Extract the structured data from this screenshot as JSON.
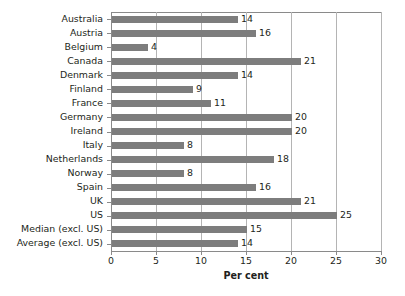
{
  "chart_data": {
    "type": "bar",
    "orientation": "horizontal",
    "title": "",
    "xlabel": "Per cent",
    "ylabel": "",
    "xlim": [
      0,
      30
    ],
    "xticks": [
      0,
      5,
      10,
      15,
      20,
      25,
      30
    ],
    "grid": "vertical",
    "legend": "none",
    "data_labels": true,
    "categories": [
      "Australia",
      "Austria",
      "Belgium",
      "Canada",
      "Denmark",
      "Finland",
      "France",
      "Germany",
      "Ireland",
      "Italy",
      "Netherlands",
      "Norway",
      "Spain",
      "UK",
      "US",
      "Median (excl. US)",
      "Average (excl. US)"
    ],
    "values": [
      14,
      16,
      4,
      21,
      14,
      9,
      11,
      20,
      20,
      8,
      18,
      8,
      16,
      21,
      25,
      15,
      14
    ],
    "value_labels": [
      "14",
      "16",
      "4",
      "21",
      "14",
      "9",
      "11",
      "20",
      "20",
      "8",
      "18",
      "8",
      "16",
      "21",
      "25",
      "15",
      "14"
    ],
    "colors": {
      "bar": "#7d7d7d",
      "axis": "#8a8a8a",
      "gridline": "#b4b4b4",
      "text": "#231f20",
      "background": "#ffffff"
    }
  },
  "axis": {
    "tick_labels": [
      "0",
      "5",
      "10",
      "15",
      "20",
      "25",
      "30"
    ],
    "title": "Per cent"
  }
}
